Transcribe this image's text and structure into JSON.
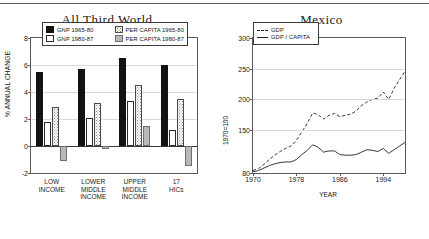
{
  "chart_data": [
    {
      "type": "bar",
      "title": "All Third World",
      "xlabel": "",
      "ylabel": "% ANNUAL CHANGE",
      "ylim": [
        -2,
        8
      ],
      "yticks": [
        "8",
        "6",
        "4",
        "2",
        "0",
        "-2"
      ],
      "grid": true,
      "legend_position": "top-inside",
      "categories": [
        "LOW\nINCOME",
        "LOWER\nMIDDLE\nINCOME",
        "UPPER\nMIDDLE\nINCOME",
        "17\nHICs"
      ],
      "series": [
        {
          "name": "GNP 1965-80",
          "style": "black",
          "values": [
            5.5,
            5.7,
            6.5,
            6.0
          ]
        },
        {
          "name": "GNP 1980-87",
          "style": "white",
          "values": [
            1.8,
            2.1,
            3.35,
            1.2
          ]
        },
        {
          "name": "PER CAPITA 1965-80",
          "style": "stipple",
          "values": [
            2.9,
            3.2,
            4.5,
            3.5
          ]
        },
        {
          "name": "PER CAPITA 1980-87",
          "style": "gray",
          "values": [
            -1.1,
            -0.2,
            1.5,
            -1.5
          ]
        }
      ]
    },
    {
      "type": "line",
      "title": "Mexico",
      "xlabel": "YEAR",
      "ylabel": "1970=100",
      "xlim": [
        1970,
        1998
      ],
      "ylim": [
        80,
        300
      ],
      "xticks": [
        "1970",
        "1978",
        "1986",
        "1994"
      ],
      "yticks": [
        "300",
        "250",
        "200",
        "150",
        "80"
      ],
      "grid": true,
      "legend_position": "top-left-inside",
      "series": [
        {
          "name": "GDP",
          "style": "dashed",
          "x": [
            1970,
            1971,
            1972,
            1973,
            1974,
            1975,
            1976,
            1977,
            1978,
            1979,
            1980,
            1981,
            1982,
            1983,
            1984,
            1985,
            1986,
            1987,
            1988,
            1989,
            1990,
            1991,
            1992,
            1993,
            1994,
            1995,
            1996,
            1997,
            1998
          ],
          "values": [
            84,
            87,
            94,
            102,
            109,
            115,
            120,
            124,
            133,
            147,
            161,
            178,
            175,
            168,
            174,
            177,
            172,
            174,
            176,
            181,
            190,
            196,
            200,
            202,
            212,
            200,
            218,
            232,
            246
          ]
        },
        {
          "name": "GDP/CAPITA",
          "style": "solid",
          "x": [
            1970,
            1971,
            1972,
            1973,
            1974,
            1975,
            1976,
            1977,
            1978,
            1979,
            1980,
            1981,
            1982,
            1983,
            1984,
            1985,
            1986,
            1987,
            1988,
            1989,
            1990,
            1991,
            1992,
            1993,
            1994,
            1995,
            1996,
            1997,
            1998
          ],
          "values": [
            82,
            84,
            88,
            92,
            95,
            97,
            98,
            98,
            102,
            110,
            117,
            126,
            122,
            114,
            116,
            116,
            110,
            109,
            109,
            110,
            114,
            118,
            117,
            115,
            120,
            112,
            118,
            124,
            130
          ]
        }
      ]
    }
  ],
  "left_chart": {
    "title": "All Third World",
    "ylabel": "% ANNUAL CHANGE",
    "yticks": [
      "8",
      "6",
      "4",
      "2",
      "0",
      "-2"
    ],
    "categories": [
      {
        "label": "LOW\nINCOME"
      },
      {
        "label": "LOWER\nMIDDLE\nINCOME"
      },
      {
        "label": "UPPER\nMIDDLE\nINCOME"
      },
      {
        "label": "17\nHICs"
      }
    ],
    "legend": [
      {
        "label": "GNP 1965-80",
        "style": "s0"
      },
      {
        "label": "PER CAPITA 1965-80",
        "style": "s2"
      },
      {
        "label": "GNP 1980-87",
        "style": "s1"
      },
      {
        "label": "PER CAPITA 1980-87",
        "style": "s3"
      }
    ]
  },
  "right_chart": {
    "title": "Mexico",
    "ylabel": "1970=100",
    "xlabel": "YEAR",
    "yticks": [
      "300",
      "250",
      "200",
      "150",
      "80"
    ],
    "xticks": [
      "1970",
      "1978",
      "1986",
      "1994"
    ],
    "legend": [
      {
        "label": "GDP",
        "style": "dashed"
      },
      {
        "label": "GDP / CAPITA",
        "style": "solid"
      }
    ]
  },
  "colors": {
    "series_black": "#121212",
    "series_white": "#ffffff",
    "series_stipple": "#f2f2f2",
    "series_gray": "#b8b8b8",
    "axis": "#5a5a5a",
    "grid": "#d8d8d8"
  }
}
